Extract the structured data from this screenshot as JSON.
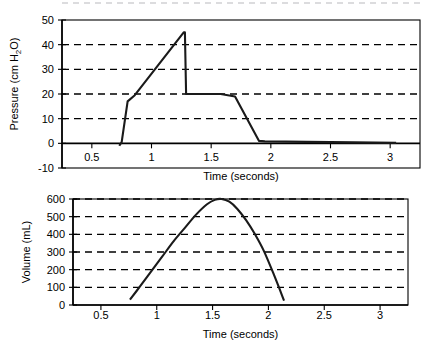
{
  "figure": {
    "width": 430,
    "height": 346,
    "background": "#ffffff",
    "ink_color": "#000000",
    "series_color": "#1a1a1a",
    "panel_count": 2
  },
  "chart_data": [
    {
      "id": "pressure-waveform",
      "type": "line",
      "title": "",
      "xlabel": "Time (seconds)",
      "ylabel": "Pressure (cm H2O)",
      "ylabel_display": "Pressure (cm H",
      "ylabel_subscript": "2",
      "ylabel_suffix": "O)",
      "xlim": [
        0.25,
        3.25
      ],
      "ylim": [
        -10,
        50
      ],
      "xticks": [
        0.5,
        1,
        1.5,
        2,
        2.5,
        3
      ],
      "xticklabels": [
        "0.5",
        "1",
        "1.5",
        "2",
        "2.5",
        "3"
      ],
      "yticks": [
        -10,
        0,
        10,
        20,
        30,
        40,
        50
      ],
      "yticklabels": [
        "-10",
        "0",
        "10",
        "20",
        "30",
        "40",
        "50"
      ],
      "grid": true,
      "gridlines_y": [
        10,
        20,
        30,
        40
      ],
      "grid_style": "dashed",
      "legend": "none",
      "x": [
        0.73,
        0.75,
        0.8,
        0.86,
        1.27,
        1.28,
        1.29,
        1.4,
        1.58,
        1.7,
        1.9,
        1.95,
        2.3,
        2.7,
        3.05
      ],
      "y": [
        -1,
        0.5,
        17,
        19.5,
        45,
        45,
        20,
        20,
        20,
        19,
        1,
        0.8,
        0.6,
        0.4,
        0.2
      ],
      "annotations": [
        {
          "label": "peak inspiratory pressure",
          "x": 1.27,
          "y": 45
        },
        {
          "label": "plateau pressure",
          "x": 1.5,
          "y": 20
        }
      ]
    },
    {
      "id": "volume-waveform",
      "type": "line",
      "title": "",
      "xlabel": "Time (seconds)",
      "ylabel": "Volume (mL)",
      "xlim": [
        0.25,
        3.25
      ],
      "ylim": [
        0,
        600
      ],
      "xticks": [
        0.5,
        1,
        1.5,
        2,
        2.5,
        3
      ],
      "xticklabels": [
        "0.5",
        "1",
        "1.5",
        "2",
        "2.5",
        "3"
      ],
      "yticks": [
        0,
        100,
        200,
        300,
        400,
        500,
        600
      ],
      "yticklabels": [
        "0",
        "100",
        "200",
        "300",
        "400",
        "500",
        "600"
      ],
      "grid": true,
      "gridlines_y": [
        100,
        200,
        300,
        400,
        500,
        600
      ],
      "grid_style": "dashed",
      "legend": "none",
      "x": [
        0.76,
        0.85,
        0.95,
        1.05,
        1.15,
        1.25,
        1.35,
        1.45,
        1.52,
        1.58,
        1.65,
        1.72,
        1.8,
        1.88,
        1.96,
        2.05,
        2.14
      ],
      "y": [
        30,
        105,
        190,
        275,
        360,
        435,
        510,
        570,
        595,
        600,
        585,
        545,
        480,
        400,
        305,
        170,
        25
      ],
      "annotations": [
        {
          "label": "peak tidal volume",
          "x": 1.58,
          "y": 600
        }
      ]
    }
  ]
}
